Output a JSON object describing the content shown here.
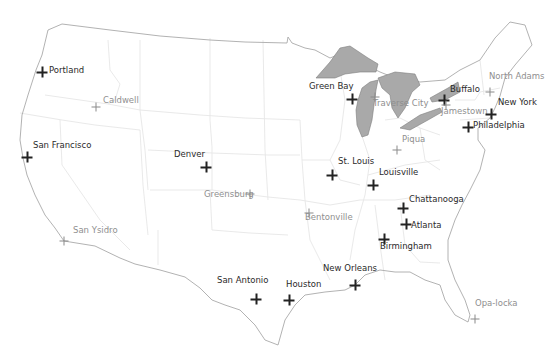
{
  "map": {
    "region": "Continental United States",
    "colors": {
      "background": "#ffffff",
      "state_border": "#e6e6e6",
      "coastline": "#a8a8a8",
      "lakes_fill": "#a9a9a9",
      "lakes_stroke": "#7d7d7d",
      "primary_marker": "#222222",
      "secondary_marker": "#8a8a8a"
    },
    "cities": [
      {
        "name": "Portland",
        "type": "primary",
        "x": 42,
        "y": 72,
        "lx": 49,
        "ly": 72
      },
      {
        "name": "Caldwell",
        "type": "secondary",
        "x": 96,
        "y": 107,
        "lx": 103,
        "ly": 102
      },
      {
        "name": "San Francisco",
        "type": "primary",
        "x": 27,
        "y": 157,
        "lx": 33,
        "ly": 147
      },
      {
        "name": "San Ysidro",
        "type": "secondary",
        "x": 64,
        "y": 241,
        "lx": 73,
        "ly": 232
      },
      {
        "name": "Denver",
        "type": "primary",
        "x": 206,
        "y": 167,
        "lx": 174,
        "ly": 156
      },
      {
        "name": "Greensburg",
        "type": "secondary",
        "x": 250,
        "y": 194,
        "lx": 204,
        "ly": 196
      },
      {
        "name": "Green Bay",
        "type": "primary",
        "x": 352,
        "y": 99,
        "lx": 309,
        "ly": 88
      },
      {
        "name": "Traverse City",
        "type": "secondary",
        "x": 375,
        "y": 97,
        "lx": 373,
        "ly": 105
      },
      {
        "name": "Buffalo",
        "type": "primary",
        "x": 444,
        "y": 100,
        "lx": 450,
        "ly": 91
      },
      {
        "name": "Jamestown",
        "type": "secondary",
        "x": 446,
        "y": 105,
        "lx": 441,
        "ly": 113
      },
      {
        "name": "North Adams",
        "type": "secondary",
        "x": 490,
        "y": 92,
        "lx": 489,
        "ly": 78
      },
      {
        "name": "New York",
        "type": "primary",
        "x": 491,
        "y": 114,
        "lx": 498,
        "ly": 104
      },
      {
        "name": "Philadelphia",
        "type": "primary",
        "x": 468,
        "y": 127,
        "lx": 473,
        "ly": 127
      },
      {
        "name": "Piqua",
        "type": "secondary",
        "x": 397,
        "y": 150,
        "lx": 402,
        "ly": 141
      },
      {
        "name": "St. Louis",
        "type": "primary",
        "x": 332,
        "y": 175,
        "lx": 338,
        "ly": 163
      },
      {
        "name": "Louisville",
        "type": "primary",
        "x": 373,
        "y": 185,
        "lx": 379,
        "ly": 174
      },
      {
        "name": "Bentonville",
        "type": "secondary",
        "x": 309,
        "y": 213,
        "lx": 305,
        "ly": 219
      },
      {
        "name": "Chattanooga",
        "type": "primary",
        "x": 403,
        "y": 208,
        "lx": 409,
        "ly": 201
      },
      {
        "name": "Atlanta",
        "type": "primary",
        "x": 406,
        "y": 224,
        "lx": 411,
        "ly": 227
      },
      {
        "name": "Birmingham",
        "type": "primary",
        "x": 384,
        "y": 239,
        "lx": 380,
        "ly": 248
      },
      {
        "name": "New Orleans",
        "type": "primary",
        "x": 355,
        "y": 285,
        "lx": 323,
        "ly": 270
      },
      {
        "name": "Houston",
        "type": "primary",
        "x": 289,
        "y": 300,
        "lx": 286,
        "ly": 286
      },
      {
        "name": "San Antonio",
        "type": "primary",
        "x": 256,
        "y": 299,
        "lx": 217,
        "ly": 282
      },
      {
        "name": "Opa-locka",
        "type": "secondary",
        "x": 475,
        "y": 319,
        "lx": 475,
        "ly": 305
      }
    ]
  }
}
